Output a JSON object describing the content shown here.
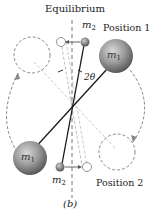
{
  "figure": {
    "title": "Equilibrium",
    "caption": "(b)",
    "position_1_label": "Position 1",
    "position_2_label": "Position 2",
    "angle_label": "2θ",
    "mass_large": {
      "symbol": "m",
      "subscript": "1"
    },
    "mass_small": {
      "symbol": "m",
      "subscript": "2"
    }
  },
  "colors": {
    "background": "#ffffff",
    "rod": "#1a1a1a",
    "dashed": "#8a8a8a",
    "ball_light": "#bdbdbd",
    "ball_dark": "#5a5a5a"
  }
}
